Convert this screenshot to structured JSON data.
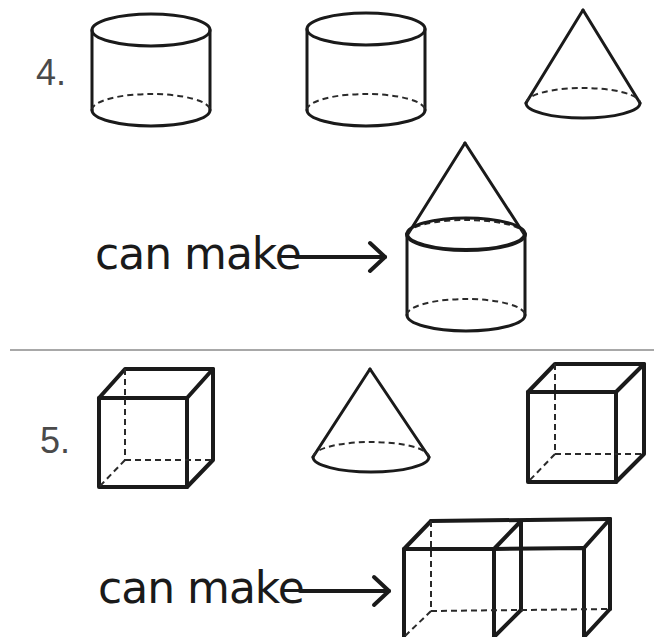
{
  "problems": [
    {
      "number": "4.",
      "shapes": [
        "cylinder",
        "cylinder",
        "cone"
      ],
      "caption": "can make",
      "result": "cone-on-cylinder"
    },
    {
      "number": "5.",
      "shapes": [
        "cube",
        "cone",
        "cube"
      ],
      "caption": "can make",
      "result": "two-cubes-joined"
    }
  ],
  "icons": {
    "arrow": "right-arrow-icon"
  }
}
